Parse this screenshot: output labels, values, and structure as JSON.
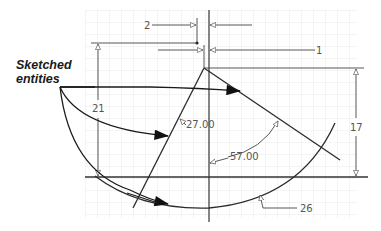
{
  "callout": {
    "line1": "Sketched",
    "line2": "entities"
  },
  "dimensions": {
    "horizontal_offset_top": "2",
    "horizontal_offset_mid": "1",
    "left_height": "21",
    "right_height": "17",
    "line_angle": "27.00",
    "angle_between": "57.00",
    "arc_radius": "26"
  },
  "colors": {
    "grid": "#e4e4e4",
    "geometry": "#2b2b2b",
    "dimension": "#444444",
    "dimension_text": "#555555",
    "callout_text": "#1a1a1a"
  }
}
